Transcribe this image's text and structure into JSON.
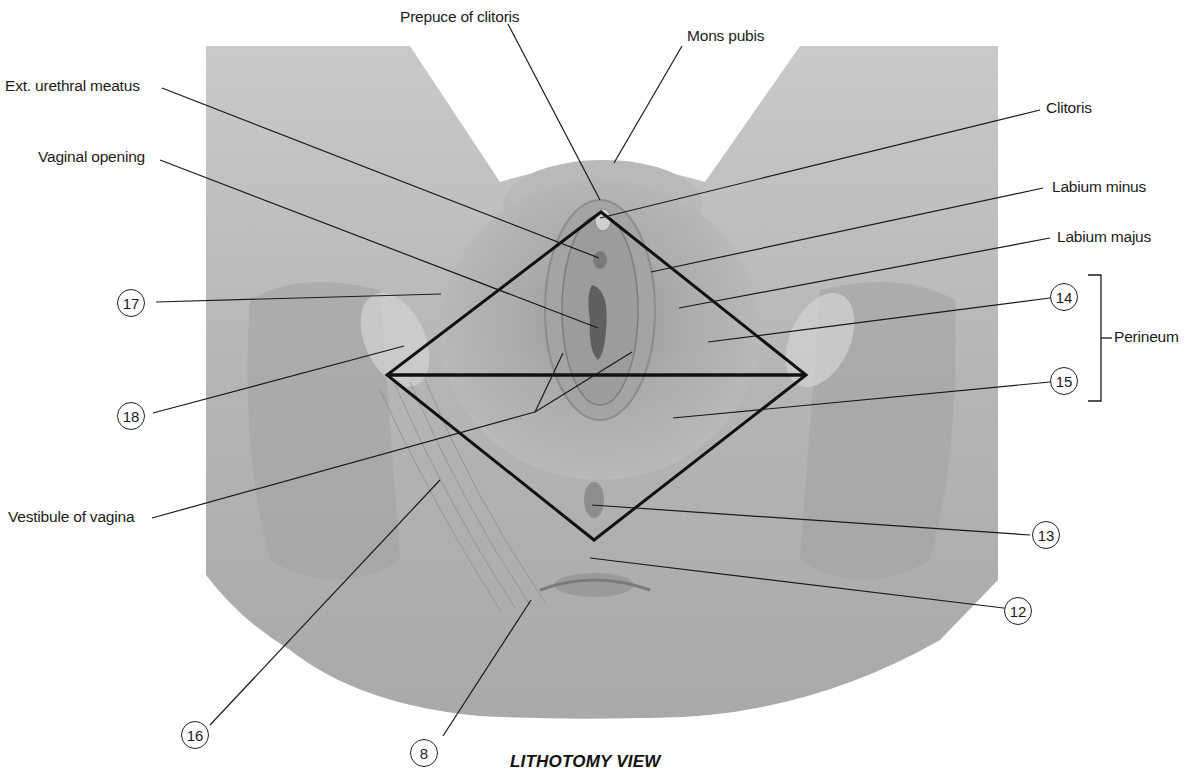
{
  "diagram": {
    "caption": "LITHOTOMY VIEW",
    "colors": {
      "background": "#ffffff",
      "illustration_fill": "#b8b8b8",
      "illustration_dark": "#8f8f8f",
      "line": "#1a1a1a"
    },
    "labels": {
      "prepuce_of_clitoris": "Prepuce of clitoris",
      "mons_pubis": "Mons pubis",
      "ext_urethral_meatus": "Ext. urethral meatus",
      "vaginal_opening": "Vaginal opening",
      "clitoris": "Clitoris",
      "labium_minus": "Labium minus",
      "labium_majus": "Labium majus",
      "perineum": "Perineum",
      "vestibule_of_vagina": "Vestibule of vagina"
    },
    "callouts": {
      "c17": "17",
      "c18": "18",
      "c14": "14",
      "c15": "15",
      "c13": "13",
      "c12": "12",
      "c16": "16",
      "c8": "8"
    },
    "overlay_shapes": {
      "diamond": {
        "top": [
          601,
          212
        ],
        "left": [
          387,
          375
        ],
        "right": [
          806,
          375
        ],
        "bottom": [
          594,
          540
        ]
      },
      "bisector": {
        "from": [
          387,
          375
        ],
        "to": [
          806,
          375
        ]
      },
      "bracket": {
        "label": "Perineum",
        "groups": [
          "14",
          "15"
        ]
      }
    }
  }
}
